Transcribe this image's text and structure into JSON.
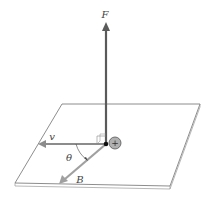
{
  "diagram": {
    "type": "physics-vector-diagram",
    "labels": {
      "force": "F",
      "velocity": "v",
      "field": "B",
      "angle": "θ",
      "charge": "+"
    },
    "colors": {
      "force_arrow": "#5a5a5a",
      "velocity_arrow": "#8c8c8c",
      "field_arrow": "#a0a0a0",
      "plane_edge": "#707070",
      "charge_fill": "#b0b0b0"
    },
    "geometry": {
      "origin": [
        106,
        144
      ],
      "force_tip": [
        106,
        22
      ],
      "velocity_tip": [
        38,
        144
      ],
      "field_tip": [
        60,
        183
      ],
      "plane": [
        [
          62,
          104
        ],
        [
          200,
          104
        ],
        [
          170,
          186
        ],
        [
          15,
          183
        ]
      ]
    }
  }
}
